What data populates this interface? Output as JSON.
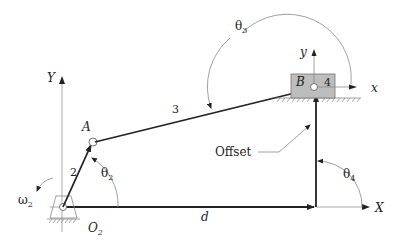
{
  "diagram": {
    "type": "slider-crank mechanism (offset)",
    "labels": {
      "global_y_axis": "Y",
      "global_x_axis": "X",
      "local_y_axis": "y",
      "local_x_axis": "x",
      "point_a": "A",
      "point_b": "B",
      "ground_pivot": "O",
      "ground_pivot_sub": "2",
      "link_2": "2",
      "link_3": "3",
      "link_4": "4",
      "theta_2": "θ",
      "theta_2_sub": "2",
      "theta_3": "θ",
      "theta_3_sub": "3",
      "theta_4": "θ",
      "theta_4_sub": "4",
      "omega_2": "ω",
      "omega_2_sub": "2",
      "distance_d": "d",
      "offset": "Offset"
    },
    "colors": {
      "link": "#222222",
      "axis": "#999999",
      "slider_fill": "#bdbdbd",
      "slider_stroke": "#777777",
      "arc": "#888888"
    }
  }
}
